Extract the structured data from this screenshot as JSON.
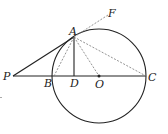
{
  "diagram": {
    "type": "geometry",
    "colors": {
      "stroke": "#222222",
      "dashed": "#777777",
      "background": "#ffffff"
    },
    "points": {
      "P": {
        "label": "P",
        "x": 13,
        "y": 76
      },
      "B": {
        "label": "B",
        "x": 54,
        "y": 76
      },
      "D": {
        "label": "D",
        "x": 74,
        "y": 76
      },
      "O": {
        "label": "O",
        "x": 99,
        "y": 76
      },
      "C": {
        "label": "C",
        "x": 146,
        "y": 76
      },
      "A": {
        "label": "A",
        "x": 74,
        "y": 37
      },
      "F": {
        "label": "F",
        "x": 110,
        "y": 13
      }
    },
    "circle": {
      "center": "O",
      "radius": 47
    },
    "segments_solid": [
      "PA",
      "PC",
      "AD"
    ],
    "segments_dashed": [
      "AB",
      "AO",
      "AC",
      "AF"
    ]
  }
}
